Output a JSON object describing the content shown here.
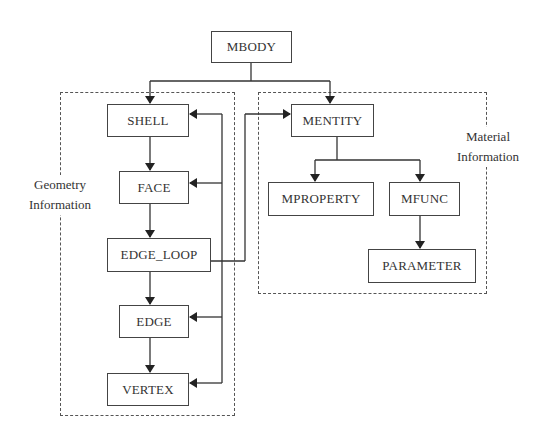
{
  "diagram": {
    "root": {
      "label": "MBODY"
    },
    "groups": [
      {
        "id": "geometry",
        "label_line1": "Geometry",
        "label_line2": "Information"
      },
      {
        "id": "material",
        "label_line1": "Material",
        "label_line2": "Information"
      }
    ],
    "nodes": {
      "mbody": "MBODY",
      "shell": "SHELL",
      "face": "FACE",
      "edge_loop": "EDGE_LOOP",
      "edge": "EDGE",
      "vertex": "VERTEX",
      "mentity": "MENTITY",
      "mproperty": "MPROPERTY",
      "mfunc": "MFUNC",
      "parameter": "PARAMETER"
    },
    "edges": [
      {
        "from": "MBODY",
        "to": "SHELL"
      },
      {
        "from": "MBODY",
        "to": "MENTITY"
      },
      {
        "from": "SHELL",
        "to": "FACE"
      },
      {
        "from": "FACE",
        "to": "EDGE_LOOP"
      },
      {
        "from": "EDGE_LOOP",
        "to": "EDGE"
      },
      {
        "from": "EDGE",
        "to": "VERTEX"
      },
      {
        "from": "EDGE_LOOP",
        "to": "MENTITY"
      },
      {
        "from": "EDGE_LOOP",
        "to": "SHELL"
      },
      {
        "from": "EDGE_LOOP",
        "to": "FACE"
      },
      {
        "from": "EDGE_LOOP",
        "to": "EDGE"
      },
      {
        "from": "EDGE_LOOP",
        "to": "VERTEX"
      },
      {
        "from": "MENTITY",
        "to": "MPROPERTY"
      },
      {
        "from": "MENTITY",
        "to": "MFUNC"
      },
      {
        "from": "MFUNC",
        "to": "PARAMETER"
      }
    ]
  }
}
